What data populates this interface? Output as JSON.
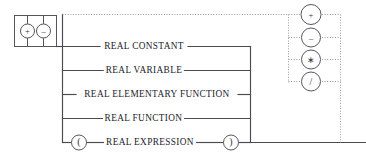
{
  "diagram": {
    "title": "REAL EXPRESSION",
    "type": "railroad-syntax-diagram",
    "colors": {
      "solid_rail": "#4a4a52",
      "dotted_rail": "#9a9aa2",
      "text": "#22222a",
      "background": "#ffffff"
    }
  },
  "sign_block": {
    "name": "optional-leading-sign",
    "options": [
      {
        "id": "plus",
        "glyph": "+",
        "icon": "plus-circle-icon"
      },
      {
        "id": "minus",
        "glyph": "–",
        "icon": "minus-circle-icon"
      }
    ]
  },
  "terms": [
    {
      "id": "real-constant",
      "label": "REAL CONSTANT"
    },
    {
      "id": "real-variable",
      "label": "REAL VARIABLE"
    },
    {
      "id": "real-elementary-function",
      "label": "REAL ELEMENTARY FUNCTION"
    },
    {
      "id": "real-function",
      "label": "REAL FUNCTION"
    },
    {
      "id": "real-expression",
      "label": "REAL EXPRESSION"
    }
  ],
  "parentheses": {
    "open": {
      "glyph": "(",
      "icon": "open-paren-circle-icon"
    },
    "close": {
      "glyph": ")",
      "icon": "close-paren-circle-icon"
    }
  },
  "operators": [
    {
      "id": "add",
      "glyph": "+",
      "icon": "plus-circle-icon"
    },
    {
      "id": "subtract",
      "glyph": "–",
      "icon": "minus-circle-icon"
    },
    {
      "id": "multiply",
      "glyph": "∗",
      "icon": "asterisk-circle-icon"
    },
    {
      "id": "divide",
      "glyph": "/",
      "icon": "slash-circle-icon"
    }
  ]
}
